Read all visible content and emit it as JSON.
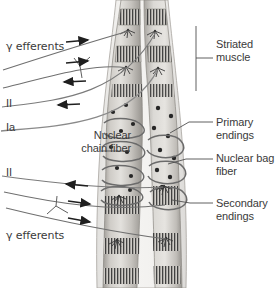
{
  "figure": {
    "background_color": "#ffffff",
    "colors": {
      "muscle_fill": "#d8d6d2",
      "muscle_shade": "#b8b5b0",
      "striation_dark": "#4a4a4a",
      "capsule_fill": "#ebeae7",
      "nerve_line": "#6e6e6e",
      "afferent_line": "#8a8a8a",
      "label_text": "#3a3a3a",
      "leader_line": "#555555",
      "nucleus_dot": "#2b2b2b"
    }
  },
  "labels": {
    "left": [
      {
        "id": "gamma-efferents-top",
        "text": "γ efferents",
        "x": 6,
        "y": 41
      },
      {
        "id": "afferent-two-top",
        "text": "II",
        "x": 6,
        "y": 97
      },
      {
        "id": "afferent-one-a",
        "text": "Ia",
        "x": 6,
        "y": 121
      },
      {
        "id": "nuclear-chain-fiber",
        "text": "Nuclear\nchain fiber",
        "x": 41,
        "y": 129
      },
      {
        "id": "afferent-two-bottom",
        "text": "II",
        "x": 6,
        "y": 166
      },
      {
        "id": "gamma-efferents-bottom",
        "text": "γ efferents",
        "x": 6,
        "y": 230
      }
    ],
    "right": [
      {
        "id": "striated-muscle",
        "text": "Striated\nmuscle",
        "x": 216,
        "y": 38
      },
      {
        "id": "primary-endings",
        "text": "Primary\nendings",
        "x": 216,
        "y": 116
      },
      {
        "id": "nuclear-bag-fiber",
        "text": "Nuclear bag\nfiber",
        "x": 216,
        "y": 152
      },
      {
        "id": "secondary-endings",
        "text": "Secondary\nendings",
        "x": 216,
        "y": 197
      }
    ]
  },
  "arrows": {
    "efferent_direction": "toward-spindle",
    "afferent_direction": "away-from-spindle",
    "top_group": [
      {
        "id": "arrow-efferent-1",
        "direction": "right"
      },
      {
        "id": "arrow-efferent-2",
        "direction": "right"
      },
      {
        "id": "arrow-afferent-ii",
        "direction": "left"
      },
      {
        "id": "arrow-afferent-ia",
        "direction": "left"
      }
    ],
    "bottom_group": [
      {
        "id": "arrow-afferent-ii-b",
        "direction": "left"
      },
      {
        "id": "arrow-efferent-3",
        "direction": "right"
      },
      {
        "id": "arrow-efferent-4",
        "direction": "right"
      }
    ]
  },
  "structures": {
    "intrafusal_fibers": 2,
    "spindle_capsule": "fusiform outer capsule",
    "nuclear_bag_nuclei_count": 14,
    "annulospiral_coils_left": 4,
    "annulospiral_coils_right": 3
  }
}
